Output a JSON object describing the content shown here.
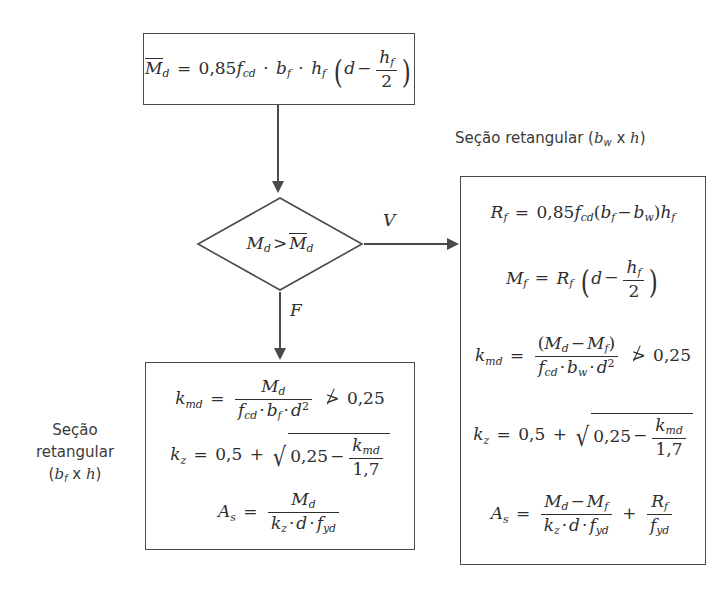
{
  "diagram": {
    "line_color": "#4a4a4a",
    "text_color": "#2e2e2e",
    "background": "#ffffff"
  },
  "top_box": {
    "name": "momento-limite-mesa",
    "equation_text": "M̄d = 0,85 fcd · bf · hf (d − hf/2)",
    "lhs": "M",
    "lhs_sub": "d",
    "eq": "=",
    "coef": "0,85",
    "f": "f",
    "f_sub": "cd",
    "b": "b",
    "b_sub": "f",
    "h": "h",
    "h_sub": "f",
    "d": "d",
    "minus": "−",
    "frac_num": "h",
    "frac_num_sub": "f",
    "frac_den": "2"
  },
  "decision": {
    "name": "comparacao-momentos",
    "text": "Md > M̄d",
    "lhs": "M",
    "lhs_sub": "d",
    "gt": ">",
    "rhs": "M",
    "rhs_sub": "d",
    "branch_true_label": "V",
    "branch_false_label": "F"
  },
  "left_caption": {
    "line1": "Seção",
    "line2": "retangular",
    "line3_open": "(",
    "line3_b": "b",
    "line3_sub": "f",
    "line3_x": " x ",
    "line3_h": "h",
    "line3_close": ")",
    "full_text": "Seção retangular (bf x h)"
  },
  "right_caption": {
    "prefix": "Seção retangular (",
    "b": "b",
    "b_sub": "w",
    "x": " x ",
    "h": "h",
    "close": ")",
    "full_text": "Seção retangular (bw x h)"
  },
  "left_box": {
    "name": "secao-retangular-bf",
    "equations": [
      {
        "id": "kmd-left",
        "text": "kmd = Md / (fcd · bf · d²) ≯ 0,25",
        "lhs": "k",
        "lhs_sub": "md",
        "eq": "=",
        "num": "M",
        "num_sub": "d",
        "den_f": "f",
        "den_f_sub": "cd",
        "den_b": "b",
        "den_b_sub": "f",
        "den_d": "d",
        "den_d_sup": "2",
        "constraint_op": "≯",
        "constraint_value": "0,25"
      },
      {
        "id": "kz-left",
        "text": "kz = 0,5 + √(0,25 − kmd/1,7)",
        "lhs": "k",
        "lhs_sub": "z",
        "eq": "=",
        "const": "0,5",
        "plus": "+",
        "radicand_const": "0,25",
        "minus": "−",
        "frac_num": "k",
        "frac_num_sub": "md",
        "frac_den": "1,7"
      },
      {
        "id": "as-left",
        "text": "As = Md / (kz · d · fyd)",
        "lhs": "A",
        "lhs_sub": "s",
        "eq": "=",
        "num": "M",
        "num_sub": "d",
        "den_k": "k",
        "den_k_sub": "z",
        "den_d": "d",
        "den_f": "f",
        "den_f_sub": "yd"
      }
    ]
  },
  "right_box": {
    "name": "secao-retangular-bw",
    "equations": [
      {
        "id": "rf-right",
        "text": "Rf = 0,85 fcd (bf − bw) hf",
        "lhs": "R",
        "lhs_sub": "f",
        "eq": "=",
        "coef": "0,85",
        "f": "f",
        "f_sub": "cd",
        "open": "(",
        "b1": "b",
        "b1_sub": "f",
        "minus": "−",
        "b2": "b",
        "b2_sub": "w",
        "close": ")",
        "h": "h",
        "h_sub": "f"
      },
      {
        "id": "mf-right",
        "text": "Mf = Rf (d − hf/2)",
        "lhs": "M",
        "lhs_sub": "f",
        "eq": "=",
        "r": "R",
        "r_sub": "f",
        "d": "d",
        "minus": "−",
        "frac_num": "h",
        "frac_num_sub": "f",
        "frac_den": "2"
      },
      {
        "id": "kmd-right",
        "text": "kmd = (Md − Mf) / (fcd · bw · d²) ≯ 0,25",
        "lhs": "k",
        "lhs_sub": "md",
        "eq": "=",
        "num_open": "(",
        "num_m1": "M",
        "num_m1_sub": "d",
        "num_minus": "−",
        "num_m2": "M",
        "num_m2_sub": "f",
        "num_close": ")",
        "den_f": "f",
        "den_f_sub": "cd",
        "den_b": "b",
        "den_b_sub": "w",
        "den_d": "d",
        "den_d_sup": "2",
        "constraint_op": "≯",
        "constraint_value": "0,25"
      },
      {
        "id": "kz-right",
        "text": "kz = 0,5 + √(0,25 − kmd/1,7)",
        "lhs": "k",
        "lhs_sub": "z",
        "eq": "=",
        "const": "0,5",
        "plus": "+",
        "radicand_const": "0,25",
        "minus": "−",
        "frac_num": "k",
        "frac_num_sub": "md",
        "frac_den": "1,7"
      },
      {
        "id": "as-right",
        "text": "As = (Md − Mf)/(kz · d · fyd) + Rf/fyd",
        "lhs": "A",
        "lhs_sub": "s",
        "eq": "=",
        "num_m1": "M",
        "num_m1_sub": "d",
        "num_minus": "−",
        "num_m2": "M",
        "num_m2_sub": "f",
        "den_k": "k",
        "den_k_sub": "z",
        "den_d": "d",
        "den_f": "f",
        "den_f_sub": "yd",
        "plus": "+",
        "t2_num": "R",
        "t2_num_sub": "f",
        "t2_den": "f",
        "t2_den_sub": "yd"
      }
    ]
  },
  "symbols": {
    "dot": "·",
    "radical": "√",
    "equals": "=",
    "multiply": "x"
  }
}
